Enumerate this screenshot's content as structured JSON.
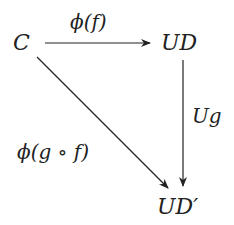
{
  "diagram": {
    "type": "commutative-diagram",
    "nodes": [
      {
        "id": "C",
        "label": "C"
      },
      {
        "id": "UD",
        "label": "UD"
      },
      {
        "id": "UDprime",
        "label": "UD′"
      }
    ],
    "edges": [
      {
        "from": "C",
        "to": "UD",
        "label": "ϕ(f)"
      },
      {
        "from": "UD",
        "to": "UDprime",
        "label": "Ug"
      },
      {
        "from": "C",
        "to": "UDprime",
        "label": "ϕ(g ∘ f)"
      }
    ],
    "colors": {
      "ink": "#222222",
      "background": "#ffffff"
    }
  }
}
